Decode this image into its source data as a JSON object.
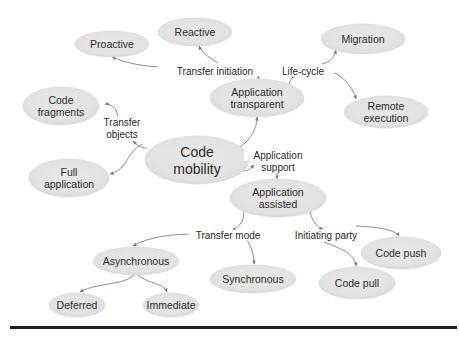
{
  "diagram": {
    "colors": {
      "node_fill": "#e4e4e4",
      "node_edge": "#d0d0d0",
      "edge": "#808080",
      "text": "#2a2a2a",
      "rule": "#1e1e1e"
    },
    "nodes": [
      {
        "id": "reactive",
        "lines": [
          "Reactive"
        ],
        "cx": 195,
        "cy": 32,
        "rx": 37,
        "ry": 14
      },
      {
        "id": "proactive",
        "lines": [
          "Proactive"
        ],
        "cx": 112,
        "cy": 44,
        "rx": 37,
        "ry": 13
      },
      {
        "id": "migration",
        "lines": [
          "Migration"
        ],
        "cx": 363,
        "cy": 39,
        "rx": 42,
        "ry": 15
      },
      {
        "id": "application-transparent",
        "lines": [
          "Application",
          "transparent"
        ],
        "cx": 257,
        "cy": 98,
        "rx": 47,
        "ry": 19
      },
      {
        "id": "remote-execution",
        "lines": [
          "Remote",
          "execution"
        ],
        "cx": 386,
        "cy": 112,
        "rx": 42,
        "ry": 16
      },
      {
        "id": "code-fragments",
        "lines": [
          "Code",
          "fragments"
        ],
        "cx": 61,
        "cy": 106,
        "rx": 38,
        "ry": 19
      },
      {
        "id": "code-mobility",
        "lines": [
          "Code",
          "mobility"
        ],
        "cx": 197,
        "cy": 160,
        "rx": 52,
        "ry": 24,
        "big": true
      },
      {
        "id": "full-application",
        "lines": [
          "Full",
          "application"
        ],
        "cx": 69,
        "cy": 178,
        "rx": 40,
        "ry": 19
      },
      {
        "id": "application-assisted",
        "lines": [
          "Application",
          "assisted"
        ],
        "cx": 278,
        "cy": 198,
        "rx": 48,
        "ry": 19
      },
      {
        "id": "asynchronous",
        "lines": [
          "Asynchronous"
        ],
        "cx": 136,
        "cy": 261,
        "rx": 43,
        "ry": 14
      },
      {
        "id": "code-push",
        "lines": [
          "Code push"
        ],
        "cx": 401,
        "cy": 253,
        "rx": 40,
        "ry": 16
      },
      {
        "id": "synchronous",
        "lines": [
          "Synchronous"
        ],
        "cx": 253,
        "cy": 279,
        "rx": 43,
        "ry": 14
      },
      {
        "id": "code-pull",
        "lines": [
          "Code pull"
        ],
        "cx": 357,
        "cy": 283,
        "rx": 38,
        "ry": 16
      },
      {
        "id": "deferred",
        "lines": [
          "Deferred"
        ],
        "cx": 77,
        "cy": 305,
        "rx": 28,
        "ry": 12
      },
      {
        "id": "immediate",
        "lines": [
          "Immediate"
        ],
        "cx": 171,
        "cy": 305,
        "rx": 28,
        "ry": 12
      }
    ],
    "edge_labels": [
      {
        "id": "transfer-initiation",
        "lines": [
          "Transfer initiation"
        ],
        "x": 215,
        "y": 71
      },
      {
        "id": "life-cycle",
        "lines": [
          "Life-cycle"
        ],
        "x": 303,
        "y": 71
      },
      {
        "id": "transfer-objects",
        "lines": [
          "Transfer",
          "objects"
        ],
        "x": 122,
        "y": 128
      },
      {
        "id": "application-support",
        "lines": [
          "Application",
          "support"
        ],
        "x": 278,
        "y": 161
      },
      {
        "id": "transfer-mode",
        "lines": [
          "Transfer mode"
        ],
        "x": 228,
        "y": 235
      },
      {
        "id": "initiating-party",
        "lines": [
          "Initiating party"
        ],
        "x": 326,
        "y": 235
      }
    ],
    "edges": [
      {
        "id": "ti-to-proactive",
        "d": "M 166 67 C 145 67, 125 63, 112 57"
      },
      {
        "id": "ti-to-reactive",
        "d": "M 218 63 C 210 58, 202 53, 199 46"
      },
      {
        "id": "ti-to-app-transparent",
        "d": "M 243 66 C 252 70, 257 74, 259 79"
      },
      {
        "id": "at-to-life-cycle",
        "d": "M 289 85 C 290 80, 292 77, 295 76"
      },
      {
        "id": "lc-to-migration",
        "d": "M 322 64 C 330 62, 334 58, 336 50"
      },
      {
        "id": "lc-to-remote",
        "d": "M 324 69 C 340 73, 352 84, 356 99"
      },
      {
        "id": "cm-to-at",
        "d": "M 240 147 C 250 140, 257 130, 257 117"
      },
      {
        "id": "cm-to-tobj",
        "d": "M 147 148 C 140 148, 136 144, 133 141"
      },
      {
        "id": "tobj-to-fragments",
        "d": "M 118 116 C 116 108, 112 104, 105 104"
      },
      {
        "id": "tobj-to-full",
        "d": "M 143 144 C 125 152, 130 168, 110 174"
      },
      {
        "id": "cm-to-as",
        "d": "M 243 171 C 248 171, 251 168, 254 165"
      },
      {
        "id": "as-to-aa",
        "d": "M 277 172 L 277 179"
      },
      {
        "id": "aa-to-tm",
        "d": "M 244 211 C 244 222, 238 228, 232 230"
      },
      {
        "id": "tm-to-async",
        "d": "M 196 234 C 175 234, 150 236, 133 246"
      },
      {
        "id": "tm-to-sync",
        "d": "M 247 240 C 252 248, 254 256, 254 264"
      },
      {
        "id": "aa-to-ip",
        "d": "M 310 211 C 312 222, 318 228, 323 229"
      },
      {
        "id": "ip-to-push",
        "d": "M 356 226 C 380 227, 395 230, 399 236"
      },
      {
        "id": "ip-to-pull",
        "d": "M 324 242 C 345 250, 355 255, 356 266"
      },
      {
        "id": "async-to-deferred",
        "d": "M 134 275 C 125 285, 95 283, 80 292"
      },
      {
        "id": "async-to-immediate",
        "d": "M 138 275 C 150 285, 163 282, 167 292"
      }
    ]
  }
}
